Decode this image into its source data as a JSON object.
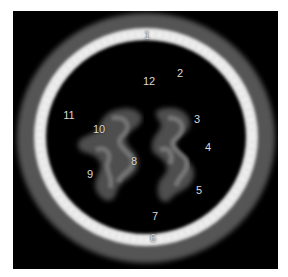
{
  "image": {
    "description": "Axial MRI brain slice with numbered anatomical labels",
    "background": "#000000",
    "border": "#ffffff"
  },
  "labels": [
    {
      "text": "1",
      "x": 147,
      "y": 35
    },
    {
      "text": "2",
      "x": 180,
      "y": 73
    },
    {
      "text": "3",
      "x": 197,
      "y": 119
    },
    {
      "text": "4",
      "x": 208,
      "y": 147
    },
    {
      "text": "5",
      "x": 199,
      "y": 190
    },
    {
      "text": "6",
      "x": 153,
      "y": 238
    },
    {
      "text": "7",
      "x": 155,
      "y": 216
    },
    {
      "text": "8",
      "x": 134,
      "y": 161
    },
    {
      "text": "9",
      "x": 90,
      "y": 174
    },
    {
      "text": "10",
      "x": 99,
      "y": 129
    },
    {
      "text": "11",
      "x": 69,
      "y": 115
    },
    {
      "text": "12",
      "x": 149,
      "y": 81
    }
  ]
}
